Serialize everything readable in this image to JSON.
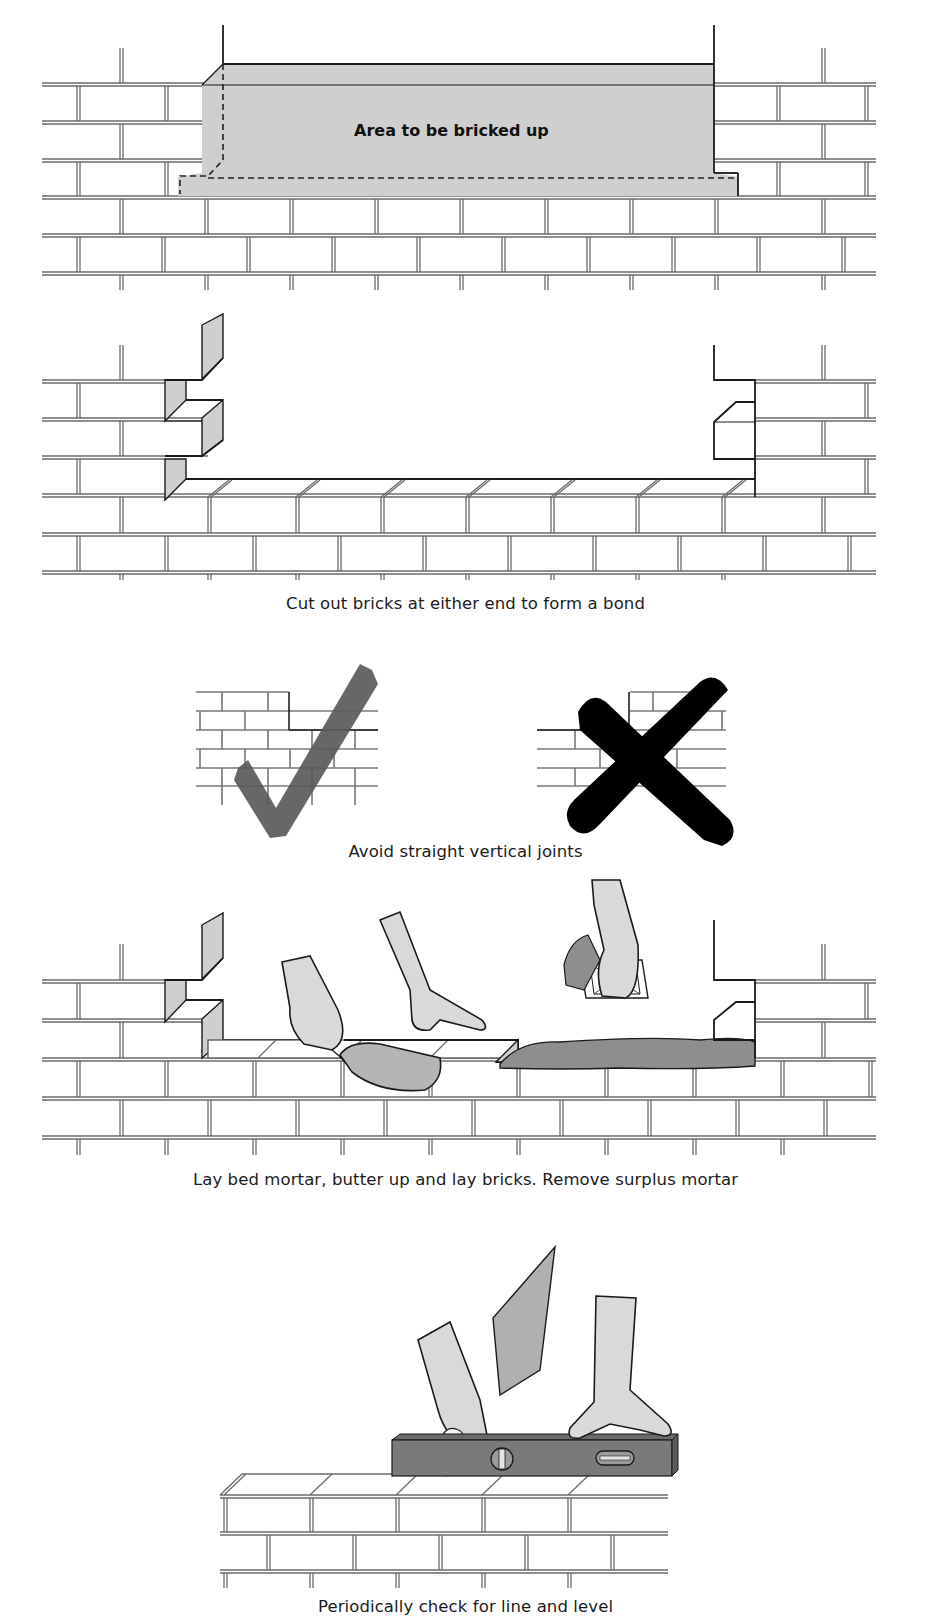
{
  "figure": {
    "type": "bricklaying-instructions",
    "colors": {
      "background": "#ffffff",
      "shaded_area": "#cfcfcf",
      "mortar_grey": "#8e8e8e",
      "tick_mark": "#5a5a5a",
      "cross_mark": "#000000",
      "spirit_level": "#7a7a7a",
      "line_ink": "#1a1a1a"
    },
    "steps": [
      {
        "id": "step-1",
        "illustration": "opening-in-brick-wall",
        "label": "Area to be bricked up"
      },
      {
        "id": "step-2",
        "illustration": "cut-out-bricks-toothing",
        "caption": "Cut out bricks at either end to form a bond"
      },
      {
        "id": "step-3",
        "illustration": "correct-vs-incorrect-bond",
        "caption": "Avoid straight vertical joints",
        "marks": [
          {
            "name": "tick",
            "meaning": "correct"
          },
          {
            "name": "cross",
            "meaning": "incorrect"
          }
        ]
      },
      {
        "id": "step-4",
        "illustration": "laying-bricks-with-trowel",
        "caption": "Lay bed mortar, butter up and lay bricks. Remove surplus mortar"
      },
      {
        "id": "step-5",
        "illustration": "spirit-level-check",
        "caption": "Periodically check for line and level"
      }
    ]
  }
}
